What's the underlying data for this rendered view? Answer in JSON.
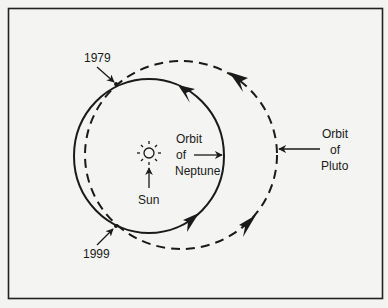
{
  "diagram": {
    "type": "orbit-diagram",
    "colors": {
      "background": "#f3f3f1",
      "ink": "#1a1a1a",
      "frame": "#222222"
    },
    "labels": {
      "year_top": "1979",
      "year_bottom": "1999",
      "sun": "Sun",
      "neptune_line1": "Orbit",
      "neptune_line2": "of",
      "neptune_line3": "Neptune",
      "pluto_line1": "Orbit",
      "pluto_line2": "of",
      "pluto_line3": "Pluto"
    },
    "elements": {
      "sun_icon": "sun-icon",
      "neptune_orbit": {
        "style": "solid",
        "direction": "counter-clockwise"
      },
      "pluto_orbit": {
        "style": "dashed",
        "direction": "counter-clockwise"
      },
      "intersections": [
        "1979",
        "1999"
      ]
    }
  }
}
